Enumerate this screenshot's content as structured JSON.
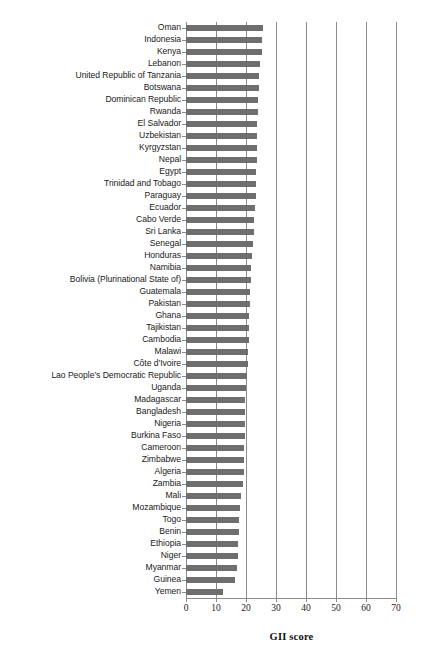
{
  "chart_data": {
    "type": "bar",
    "orientation": "horizontal",
    "title": "",
    "xlabel": "GII score",
    "ylabel": "",
    "xlim": [
      0,
      70
    ],
    "xticks": [
      0,
      10,
      20,
      30,
      40,
      50,
      60,
      70
    ],
    "grid": true,
    "legend": false,
    "bar_color": "#6e6e6e",
    "categories": [
      "Oman",
      "Indonesia",
      "Kenya",
      "Lebanon",
      "United Republic of Tanzania",
      "Botswana",
      "Dominican Republic",
      "Rwanda",
      "El Salvador",
      "Uzbekistan",
      "Kyrgyzstan",
      "Nepal",
      "Egypt",
      "Trinidad and Tobago",
      "Paraguay",
      "Ecuador",
      "Cabo Verde",
      "Sri Lanka",
      "Senegal",
      "Honduras",
      "Namibia",
      "Bolivia (Plurinational State of)",
      "Guatemala",
      "Pakistan",
      "Ghana",
      "Tajikistan",
      "Cambodia",
      "Malawi",
      "Côte d’Ivoire",
      "Lao People’s Democratic Republic",
      "Uganda",
      "Madagascar",
      "Bangladesh",
      "Nigeria",
      "Burkina Faso",
      "Cameroon",
      "Zimbabwe",
      "Algeria",
      "Zambia",
      "Mali",
      "Mozambique",
      "Togo",
      "Benin",
      "Ethiopia",
      "Niger",
      "Myanmar",
      "Guinea",
      "Yemen"
    ],
    "values": [
      25.6,
      25.4,
      25.2,
      24.8,
      24.4,
      24.3,
      24.1,
      23.9,
      23.8,
      23.7,
      23.6,
      23.5,
      23.4,
      23.3,
      23.2,
      23.0,
      22.8,
      22.5,
      22.2,
      22.0,
      21.8,
      21.5,
      21.3,
      21.2,
      21.1,
      21.0,
      20.9,
      20.8,
      20.6,
      20.4,
      19.9,
      19.8,
      19.7,
      19.6,
      19.5,
      19.4,
      19.3,
      19.2,
      19.0,
      18.4,
      18.0,
      17.8,
      17.6,
      17.4,
      17.2,
      17.0,
      16.3,
      12.4
    ]
  },
  "axis": {
    "x_title": "GII score"
  }
}
